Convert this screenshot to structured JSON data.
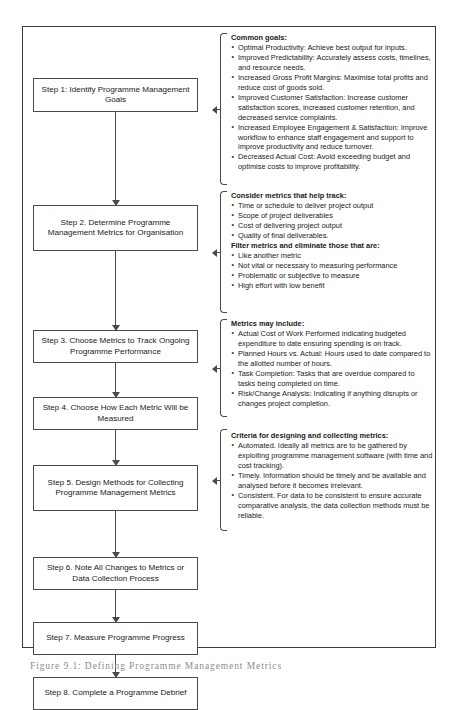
{
  "figure": {
    "caption": "Figure 9.1: Defining Programme Management Metrics",
    "frame_color": "#3b3b3b",
    "box_border_color": "#4a4a4a",
    "text_color": "#1a1a1a"
  },
  "flow": {
    "steps": [
      {
        "label": "Step 1: Identify Programme Management Goals"
      },
      {
        "label": "Step 2. Determine Programme Management Metrics for Organisation"
      },
      {
        "label": "Step 3. Choose Metrics to Track Ongoing Programme Performance"
      },
      {
        "label": "Step 4. Choose How Each Metric Will be Measured"
      },
      {
        "label": "Step 5. Design Methods for Collecting Programme Management Metrics"
      },
      {
        "label": "Step 6. Note All Changes to Metrics or Data Collection Process"
      },
      {
        "label": "Step 7. Measure Programme Progress"
      },
      {
        "label": "Step 8. Complete a Programme Debrief"
      }
    ]
  },
  "notes": [
    {
      "title": "Common goals:",
      "items": [
        "Optimal Productivity: Achieve best output for inputs.",
        "Improved Predictability: Accurately assess costs, timelines, and resource needs.",
        "Increased Gross Profit Margins: Maximise total profits and reduce cost of goods sold.",
        "Improved Customer Satisfaction: Increase customer satisfaction scores, increased customer retention, and decreased service complaints.",
        "Increased Employee Engagement & Satisfaction: Improve workflow to enhance staff engagement and support to improve productivity and reduce turnover.",
        "Decreased Actual Cost: Avoid exceeding budget and optimise costs to improve profitability."
      ]
    },
    {
      "title": "Consider metrics that help track:",
      "items": [
        "Time or schedule to deliver project output",
        "Scope of project deliverables",
        "Cost of delivering project output",
        "Quality of final deliverables."
      ],
      "title2": "Filter metrics and eliminate those that are:",
      "items2": [
        "Like another metric",
        "Not vital or necessary to measuring performance",
        "Problematic or subjective to measure",
        "High effort with low benefit"
      ]
    },
    {
      "title": "Metrics may include:",
      "items": [
        "Actual Cost of Work Performed indicating budgeted expenditure to date ensuring spending is on track.",
        "Planned Hours vs. Actual: Hours used to date compared to the allotted number of hours.",
        "Task Completion: Tasks that are overdue compared to tasks being completed on time.",
        "Risk/Change Analysis: Indicating if anything  disrupts or changes project completion."
      ]
    },
    {
      "title": "Criteria for designing and collecting metrics:",
      "items": [
        "Automated. Ideally all metrics are to be gathered by exploiting programme management software (with time and cost tracking).",
        "Timely. Information should be timely and be available and analysed before it becomes irrelevant.",
        "Consistent. For data to be consistent to ensure accurate comparative analysis, the data collection methods must be reliable."
      ]
    }
  ]
}
